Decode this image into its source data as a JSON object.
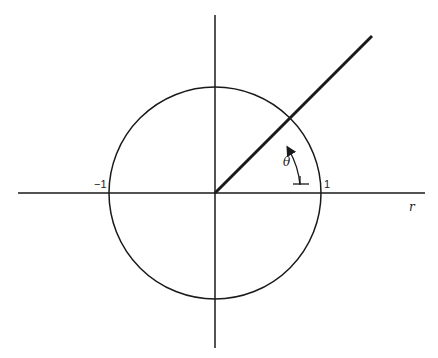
{
  "diagram": {
    "labels": {
      "neg_one": "−1",
      "pos_one": "1",
      "r_axis": "r",
      "angle": "θ"
    },
    "geometry": {
      "center": [
        215,
        193
      ],
      "radius": 106,
      "ray_end": [
        372,
        36
      ],
      "angle_deg": 45
    },
    "colors": {
      "line": "#1a1a1a",
      "background": "#ffffff"
    }
  }
}
